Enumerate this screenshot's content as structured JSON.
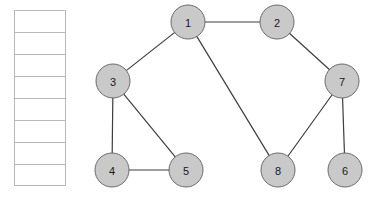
{
  "graph": {
    "node_fill": "#c9c9c9",
    "node_stroke": "#6b6b6b",
    "edge_color": "#3d3d3d",
    "node_radius": 17,
    "nodes": [
      {
        "id": "1",
        "label": "1",
        "x": 188,
        "y": 22
      },
      {
        "id": "2",
        "label": "2",
        "x": 277,
        "y": 22
      },
      {
        "id": "3",
        "label": "3",
        "x": 113,
        "y": 81
      },
      {
        "id": "7",
        "label": "7",
        "x": 342,
        "y": 81
      },
      {
        "id": "4",
        "label": "4",
        "x": 112,
        "y": 170
      },
      {
        "id": "5",
        "label": "5",
        "x": 186,
        "y": 170
      },
      {
        "id": "8",
        "label": "8",
        "x": 278,
        "y": 170
      },
      {
        "id": "6",
        "label": "6",
        "x": 345,
        "y": 170
      }
    ],
    "edges": [
      {
        "from": "1",
        "to": "2"
      },
      {
        "from": "1",
        "to": "3"
      },
      {
        "from": "1",
        "to": "8"
      },
      {
        "from": "2",
        "to": "7"
      },
      {
        "from": "3",
        "to": "4"
      },
      {
        "from": "3",
        "to": "5"
      },
      {
        "from": "4",
        "to": "5"
      },
      {
        "from": "7",
        "to": "8"
      },
      {
        "from": "7",
        "to": "6"
      }
    ]
  },
  "table": {
    "border_color": "#b8b8b8",
    "rows": [
      "",
      "",
      "",
      "",
      "",
      "",
      "",
      ""
    ]
  }
}
